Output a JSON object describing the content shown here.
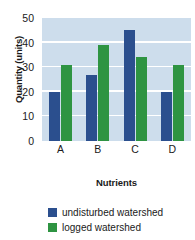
{
  "chart_data": {
    "type": "bar",
    "title": "",
    "xlabel": "Nutrients",
    "ylabel": "Quantity (units)",
    "categories": [
      "A",
      "B",
      "C",
      "D"
    ],
    "series": [
      {
        "name": "undisturbed watershed",
        "color": "#2b4f8e",
        "values": [
          20,
          27,
          45,
          20
        ]
      },
      {
        "name": "logged watershed",
        "color": "#2e9442",
        "values": [
          31,
          39,
          34,
          31
        ]
      }
    ],
    "ylim": [
      0,
      50
    ],
    "yticks": [
      0,
      10,
      20,
      30,
      40,
      50
    ],
    "ytick_labels": [
      "0",
      "10",
      "20",
      "30",
      "40",
      "50"
    ],
    "grid": true,
    "grid_color": "#ffffff",
    "plot_background": "#cdddec",
    "legend_position": "bottom-left"
  },
  "legend": {
    "items": [
      {
        "label": "undisturbed watershed"
      },
      {
        "label": "logged watershed"
      }
    ]
  },
  "axes": {
    "y_title": "Quantity (units)",
    "x_title": "Nutrients"
  }
}
